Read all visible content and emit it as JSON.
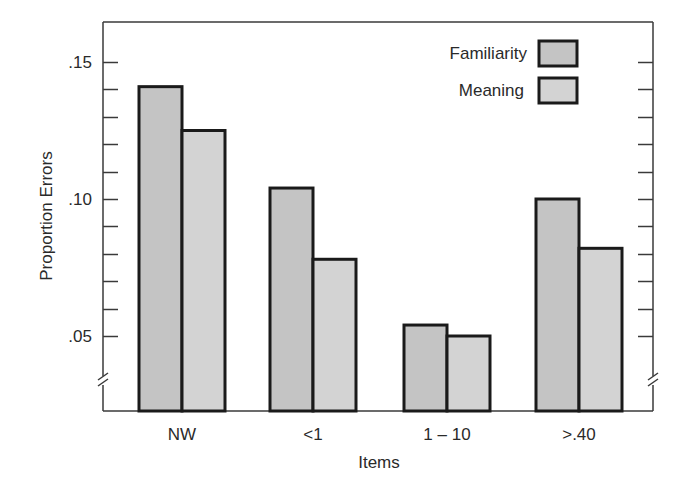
{
  "chart_data": {
    "type": "bar",
    "title": "",
    "xlabel": "Items",
    "ylabel": "Proportion Errors",
    "categories": [
      "NW",
      "<1",
      "1 – 10",
      ">.40"
    ],
    "series": [
      {
        "name": "Familiarity",
        "values": [
          0.141,
          0.104,
          0.054,
          0.1
        ],
        "color": "#c4c4c4"
      },
      {
        "name": "Meaning",
        "values": [
          0.125,
          0.078,
          0.05,
          0.082
        ],
        "color": "#d3d3d3"
      }
    ],
    "yticks": [
      0.05,
      0.1,
      0.15
    ],
    "ytick_labels": [
      ".05",
      ".10",
      ".15"
    ],
    "minor_tick_step": 0.01,
    "ylim": [
      0.035,
      0.16
    ],
    "axis_break": true,
    "grid": false,
    "legend_position": "upper right"
  },
  "legend": {
    "items": [
      {
        "label": "Familiarity"
      },
      {
        "label": "Meaning"
      }
    ]
  },
  "axes": {
    "xlabel": "Items",
    "ylabel": "Proportion Errors"
  }
}
